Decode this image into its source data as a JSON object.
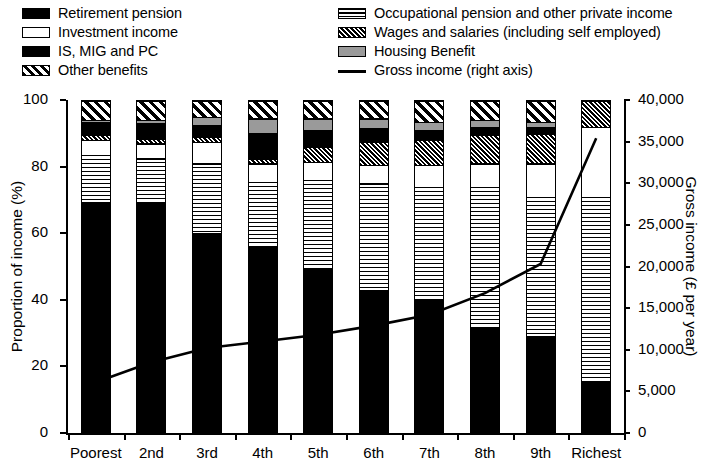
{
  "legend": {
    "left_column": [
      {
        "label": "Retirement pension",
        "swatch": "solid-black-swatch"
      },
      {
        "label": "Investment income",
        "swatch": "white-swatch"
      },
      {
        "label": "IS, MIG and PC",
        "swatch": "solid-black-swatch"
      },
      {
        "label": "Other benefits",
        "swatch": "wide-diagonal-hatch-swatch"
      }
    ],
    "right_column": [
      {
        "label": "Occupational pension and other private income",
        "swatch": "horizontal-lines-swatch"
      },
      {
        "label": "Wages and salaries (including self employed)",
        "swatch": "dense-diagonal-hatch-swatch"
      },
      {
        "label": "Housing Benefit",
        "swatch": "gray-swatch"
      },
      {
        "label": "Gross income (right axis)",
        "swatch": "line-swatch"
      }
    ]
  },
  "chart_data": {
    "type": "bar",
    "title": "",
    "xlabel": "",
    "ylabel": "Proportion of income (%)",
    "y2label": "Gross income (£ per year)",
    "categories": [
      "Poorest",
      "2nd",
      "3rd",
      "4th",
      "5th",
      "6th",
      "7th",
      "8th",
      "9th",
      "Richest"
    ],
    "ylim": [
      0,
      100
    ],
    "yticks": [
      0,
      20,
      40,
      60,
      80,
      100
    ],
    "ytick_labels": [
      "0",
      "20",
      "40",
      "60",
      "80",
      "100"
    ],
    "y2lim": [
      0,
      40000
    ],
    "y2ticks": [
      0,
      5000,
      10000,
      15000,
      20000,
      25000,
      30000,
      35000,
      40000
    ],
    "y2tick_labels": [
      "0",
      "5,000",
      "10,000",
      "15,000",
      "20,000",
      "25,000",
      "30,000",
      "35,000",
      "40,000"
    ],
    "grid": false,
    "legend_position": "top",
    "stacking_order_bottom_to_top": [
      "Retirement pension",
      "Occupational pension and other private income",
      "Investment income",
      "Wages and salaries (including self employed)",
      "IS, MIG and PC",
      "Housing Benefit",
      "Other benefits"
    ],
    "series": [
      {
        "name": "Retirement pension",
        "pattern": "pat-retirement",
        "values": [
          69.5,
          69.0,
          60.0,
          56.0,
          49.5,
          43.0,
          40.0,
          31.5,
          29.0,
          15.5
        ]
      },
      {
        "name": "Occupational pension and other private income",
        "pattern": "pat-occupational",
        "values": [
          14.0,
          13.5,
          21.0,
          19.5,
          26.5,
          32.0,
          34.0,
          42.5,
          42.0,
          55.5
        ]
      },
      {
        "name": "Investment income",
        "pattern": "pat-investment",
        "values": [
          4.5,
          4.5,
          6.5,
          5.5,
          5.5,
          5.5,
          6.5,
          7.0,
          10.0,
          21.0
        ]
      },
      {
        "name": "Wages and salaries (including self employed)",
        "pattern": "pat-wages",
        "values": [
          1.5,
          1.5,
          1.5,
          1.5,
          4.5,
          7.0,
          7.5,
          8.5,
          9.0,
          8.0
        ]
      },
      {
        "name": "IS, MIG and PC",
        "pattern": "pat-ismigpc",
        "values": [
          4.0,
          4.5,
          3.5,
          7.5,
          5.0,
          4.0,
          3.0,
          2.5,
          2.0,
          0.0
        ]
      },
      {
        "name": "Housing Benefit",
        "pattern": "pat-housing",
        "values": [
          0.5,
          1.0,
          2.5,
          4.5,
          3.5,
          3.0,
          2.5,
          2.0,
          1.5,
          0.0
        ]
      },
      {
        "name": "Other benefits",
        "pattern": "pat-other",
        "values": [
          6.0,
          6.0,
          5.0,
          5.5,
          5.5,
          5.5,
          6.5,
          6.0,
          6.5,
          0.0
        ]
      }
    ],
    "line_series": {
      "name": "Gross income (right axis)",
      "axis": "right",
      "values": [
        6100,
        8500,
        10200,
        11000,
        11800,
        12900,
        14200,
        16800,
        20300,
        35400
      ]
    }
  }
}
